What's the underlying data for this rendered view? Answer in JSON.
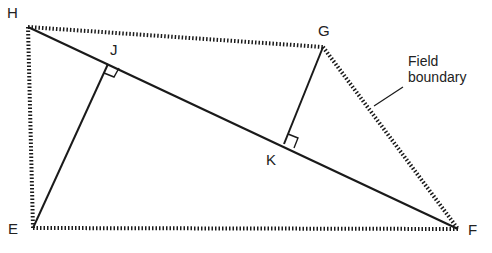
{
  "diagram": {
    "type": "geometry-field-survey",
    "colors": {
      "line": "#1a1a1a",
      "boundary": "#1a1a1a",
      "text": "#222222",
      "background": "#ffffff"
    },
    "points": {
      "H": {
        "label": "H",
        "x": 28,
        "y": 27
      },
      "G": {
        "label": "G",
        "x": 323,
        "y": 47
      },
      "F": {
        "label": "F",
        "x": 458,
        "y": 229
      },
      "E": {
        "label": "E",
        "x": 33,
        "y": 228
      },
      "J": {
        "label": "J",
        "x": 108,
        "y": 64
      },
      "K": {
        "label": "K",
        "x": 284,
        "y": 144
      }
    },
    "labels": {
      "H": "H",
      "G": "G",
      "F": "F",
      "E": "E",
      "J": "J",
      "K": "K"
    },
    "annotation": {
      "line1": "Field",
      "line2": "boundary"
    },
    "boundary_polygon": [
      "H",
      "G",
      "F",
      "E"
    ],
    "solid_lines": [
      [
        "H",
        "F"
      ],
      [
        "E",
        "J"
      ],
      [
        "G",
        "K"
      ]
    ],
    "right_angles": [
      "J",
      "K"
    ]
  }
}
